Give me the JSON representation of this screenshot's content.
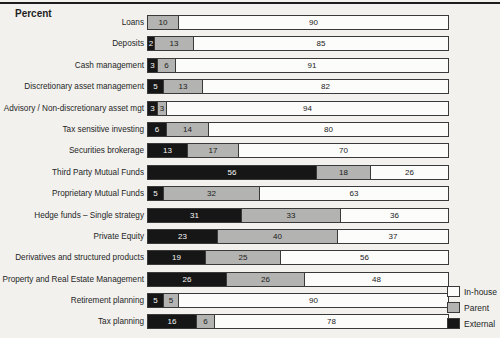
{
  "unit_label": "Percent",
  "chart_data": {
    "type": "bar",
    "orientation": "horizontal",
    "stacked": true,
    "title": "Percent",
    "value_unit": "percent",
    "xlim": [
      0,
      100
    ],
    "px_per_percent": 3,
    "categories": [
      "Loans",
      "Deposits",
      "Cash management",
      "Discretionary asset management",
      "Advisory / Non-discretionary asset mgt",
      "Tax sensitive investing",
      "Securities brokerage",
      "Third Party Mutual Funds",
      "Proprietary Mutual Funds",
      "Hedge funds – Single strategy",
      "Private Equity",
      "Derivatives and structured products",
      "Property and Real Estate Management",
      "Retirement planning",
      "Tax planning"
    ],
    "series": [
      {
        "name": "External",
        "color": "#161616",
        "text_color": "#f6f6f6",
        "values": [
          0,
          2,
          3,
          5,
          3,
          6,
          13,
          56,
          5,
          31,
          23,
          19,
          26,
          5,
          16
        ]
      },
      {
        "name": "Parent",
        "color": "#b3b3b1",
        "text_color": "#1a1a1a",
        "values": [
          10,
          13,
          6,
          13,
          3,
          14,
          17,
          18,
          32,
          33,
          40,
          25,
          26,
          5,
          6
        ]
      },
      {
        "name": "In-house",
        "color": "#fcfcfb",
        "text_color": "#1a1a1a",
        "values": [
          90,
          85,
          91,
          82,
          94,
          80,
          70,
          26,
          63,
          36,
          37,
          56,
          48,
          90,
          78
        ]
      }
    ],
    "legend": {
      "position": "bottom-right",
      "items": [
        {
          "label": "In-house",
          "color": "#fcfcfb"
        },
        {
          "label": "Parent",
          "color": "#b3b3b1"
        },
        {
          "label": "External",
          "color": "#161616"
        }
      ]
    }
  }
}
